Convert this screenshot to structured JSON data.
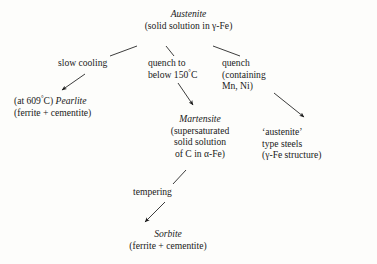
{
  "diagram": {
    "title_node": {
      "name": "Austenite",
      "line1": "Austenite",
      "line2": "(solid solution in γ-Fe)"
    },
    "nodes": [
      {
        "id": "pearlite",
        "line1_prefix": "(at 609",
        "line1_deg": "°",
        "line1_mid": "C) ",
        "line1_name": "Pearlite",
        "line2": "(ferrite + cementite)"
      },
      {
        "id": "martensite",
        "line1": "Martensite",
        "line2": "(supersaturated",
        "line3": "solid solution",
        "line4": "of C in α-Fe)"
      },
      {
        "id": "austenite-type-steels",
        "line1": "‘austenite’",
        "line2": "type steels",
        "line3": "(γ-Fe structure)"
      },
      {
        "id": "sorbite",
        "line1": "Sorbite",
        "line2": "(ferrite + cementite)"
      }
    ],
    "edges": [
      {
        "id": "slow-cooling",
        "line1": "slow cooling"
      },
      {
        "id": "quench-to-below-150",
        "line1": "quench to",
        "line2_prefix": "below 150",
        "line2_deg": "°",
        "line2_suffix": "C"
      },
      {
        "id": "quench-containing-mn-ni",
        "line1": "quench",
        "line2": "(containing",
        "line3": "Mn, Ni)"
      },
      {
        "id": "tempering",
        "line1": "tempering"
      }
    ],
    "colors": {
      "ink": "#1a1a1a",
      "background": "#fdfdfb"
    }
  }
}
